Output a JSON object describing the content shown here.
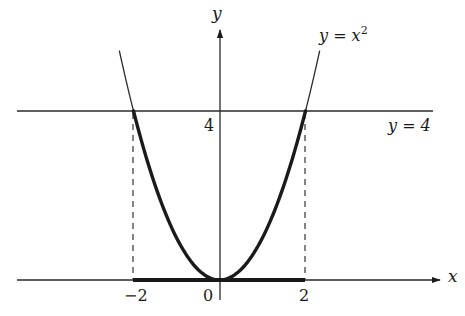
{
  "diagram": {
    "type": "function-graph",
    "colors": {
      "ink": "#1a1a1a",
      "axis": "#2a2a2a",
      "background": "#ffffff"
    },
    "axes": {
      "x_label": "x",
      "y_label": "y",
      "x_ticks": [
        {
          "value": -2,
          "label": "−2"
        },
        {
          "value": 0,
          "label": "0"
        },
        {
          "value": 2,
          "label": "2"
        }
      ],
      "y_ticks": [
        {
          "value": 4,
          "label": "4"
        }
      ]
    },
    "curves": [
      {
        "name": "parabola",
        "equation_label_lhs": "y = x",
        "equation_label_exp": "2",
        "function": "x^2",
        "domain": [
          -2.33,
          2.33
        ],
        "highlighted_domain": [
          -2,
          2
        ]
      }
    ],
    "lines": [
      {
        "name": "horizontal-line",
        "label": "y = 4",
        "y": 4
      }
    ],
    "dashed_verticals": [
      {
        "x": -2,
        "from_y": 0,
        "to_y": 4
      },
      {
        "x": 2,
        "from_y": 0,
        "to_y": 4
      }
    ],
    "highlighted_segment": {
      "axis": "x",
      "from": -2,
      "to": 2
    }
  }
}
